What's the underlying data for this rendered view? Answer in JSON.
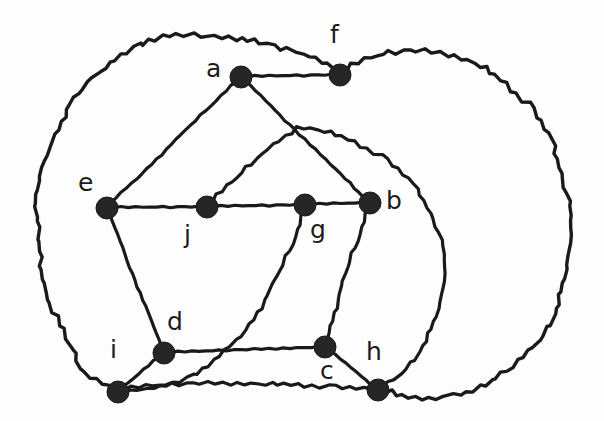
{
  "figure": {
    "kind": "planar-graph-drawing",
    "background_color": "#fdfdfd",
    "stroke_color": "#1a1a1a",
    "vertex_color": "#262626",
    "width": 604,
    "height": 421
  },
  "graph": {
    "vertex_labels": [
      "a",
      "b",
      "c",
      "d",
      "e",
      "f",
      "g",
      "h",
      "i",
      "j"
    ],
    "vertices": [
      {
        "id": "a",
        "label": "a",
        "x": 241,
        "y": 77,
        "r": 11,
        "label_x": 206,
        "label_y": 56
      },
      {
        "id": "f",
        "label": "f",
        "x": 340,
        "y": 75,
        "r": 11,
        "label_x": 330,
        "label_y": 22
      },
      {
        "id": "e",
        "label": "e",
        "x": 107,
        "y": 208,
        "r": 11,
        "label_x": 78,
        "label_y": 170
      },
      {
        "id": "j",
        "label": "j",
        "x": 207,
        "y": 207,
        "r": 11,
        "label_x": 184,
        "label_y": 222
      },
      {
        "id": "g",
        "label": "g",
        "x": 305,
        "y": 205,
        "r": 11,
        "label_x": 310,
        "label_y": 217
      },
      {
        "id": "b",
        "label": "b",
        "x": 370,
        "y": 203,
        "r": 11,
        "label_x": 386,
        "label_y": 188
      },
      {
        "id": "d",
        "label": "d",
        "x": 164,
        "y": 353,
        "r": 11,
        "label_x": 167,
        "label_y": 309
      },
      {
        "id": "i",
        "label": "i",
        "x": 118,
        "y": 392,
        "r": 11,
        "label_x": 110,
        "label_y": 337
      },
      {
        "id": "c",
        "label": "c",
        "x": 325,
        "y": 347,
        "r": 11,
        "label_x": 320,
        "label_y": 358
      },
      {
        "id": "h",
        "label": "h",
        "x": 378,
        "y": 390,
        "r": 11,
        "label_x": 366,
        "label_y": 339
      }
    ],
    "edges": [
      {
        "from": "a",
        "to": "f",
        "style": "straight",
        "d": "M 241 77 L 340 75"
      },
      {
        "from": "a",
        "to": "e",
        "style": "straight",
        "d": "M 241 77 L 107 208"
      },
      {
        "from": "a",
        "to": "b",
        "style": "straight",
        "d": "M 241 77 L 370 203"
      },
      {
        "from": "e",
        "to": "j",
        "style": "straight",
        "d": "M 107 208 L 207 207"
      },
      {
        "from": "j",
        "to": "g",
        "style": "straight",
        "d": "M 207 207 L 305 205"
      },
      {
        "from": "g",
        "to": "b",
        "style": "straight",
        "d": "M 305 205 L 370 203"
      },
      {
        "from": "e",
        "to": "d",
        "style": "straight",
        "d": "M 107 208 L 164 353"
      },
      {
        "from": "d",
        "to": "i",
        "style": "straight",
        "d": "M 164 353 L 118 392"
      },
      {
        "from": "d",
        "to": "c",
        "style": "straight",
        "d": "M 164 353 L 325 347"
      },
      {
        "from": "b",
        "to": "c",
        "style": "curve",
        "d": "M 370 203 C 357 250 336 303 325 347"
      },
      {
        "from": "c",
        "to": "h",
        "style": "straight",
        "d": "M 325 347 L 378 390"
      },
      {
        "from": "g",
        "to": "i",
        "style": "curve",
        "d": "M 305 205 C 296 255 255 330 215 363 C 188 385 148 392 118 392"
      },
      {
        "from": "j",
        "to": "h",
        "style": "curve",
        "d": "M 207 207 C 240 174 276 145 297 128 C 345 130 413 162 437 225 C 458 281 439 345 394 382 L 378 390"
      },
      {
        "from": "i",
        "to": "h",
        "style": "curve",
        "d": "M 118 392 C 180 378 300 386 378 390"
      },
      {
        "from": "f",
        "to": "i",
        "style": "outer",
        "d": "M 340 75 C 300 46 230 34 176 37 C 118 42 62 96 43 175 C 28 240 52 330 90 377 L 118 392"
      },
      {
        "from": "f",
        "to": "h",
        "style": "outer",
        "d": "M 340 75 C 390 40 462 46 510 86 C 568 136 586 230 561 303 C 538 372 462 413 400 397 L 378 390"
      }
    ]
  }
}
